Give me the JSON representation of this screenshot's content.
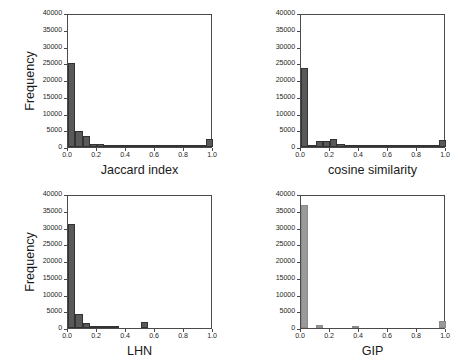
{
  "figure": {
    "width": 466,
    "height": 362,
    "background": "#ffffff",
    "layout": "2x2 grid of histogram panels"
  },
  "common": {
    "ylabel": "Frequency",
    "yticks": [
      "0",
      "5000",
      "10000",
      "15000",
      "20000",
      "25000",
      "30000",
      "35000",
      "40000"
    ],
    "ytick_values": [
      0,
      5000,
      10000,
      15000,
      20000,
      25000,
      30000,
      35000,
      40000
    ],
    "xticks": [
      "0.0",
      "0.2",
      "0.4",
      "0.6",
      "0.8",
      "1.0"
    ],
    "xtick_values": [
      0.0,
      0.2,
      0.4,
      0.6,
      0.8,
      1.0
    ],
    "ylim": [
      0,
      40000
    ],
    "xlim": [
      0.0,
      1.0
    ],
    "grid": false,
    "axis_color": "#4a4a4a"
  },
  "chart_data": [
    {
      "type": "bar",
      "id": "jaccard",
      "title": "",
      "xlabel": "Jaccard index",
      "ylabel": "Frequency",
      "xlim": [
        0.0,
        1.0
      ],
      "ylim": [
        0,
        40000
      ],
      "bin_width": 0.05,
      "bar_color": "#595959",
      "edge_color": "#333333",
      "bin_centers": [
        0.025,
        0.075,
        0.125,
        0.175,
        0.225,
        0.275,
        0.325,
        0.375,
        0.425,
        0.475,
        0.525,
        0.575,
        0.625,
        0.675,
        0.725,
        0.775,
        0.825,
        0.875,
        0.925,
        0.975
      ],
      "values": [
        25100,
        4700,
        3300,
        900,
        800,
        300,
        200,
        200,
        600,
        200,
        500,
        300,
        500,
        600,
        100,
        100,
        100,
        100,
        100,
        2300
      ]
    },
    {
      "type": "bar",
      "id": "cosine",
      "title": "",
      "xlabel": "cosine similarity",
      "ylabel": "Frequency",
      "xlim": [
        0.0,
        1.0
      ],
      "ylim": [
        0,
        40000
      ],
      "bin_width": 0.05,
      "bar_color": "#595959",
      "edge_color": "#333333",
      "bin_centers": [
        0.025,
        0.075,
        0.125,
        0.175,
        0.225,
        0.275,
        0.325,
        0.375,
        0.425,
        0.475,
        0.525,
        0.575,
        0.625,
        0.675,
        0.725,
        0.775,
        0.825,
        0.875,
        0.925,
        0.975
      ],
      "values": [
        23700,
        700,
        1900,
        1900,
        2300,
        900,
        700,
        400,
        300,
        400,
        500,
        600,
        700,
        500,
        500,
        500,
        600,
        200,
        100,
        2000
      ]
    },
    {
      "type": "bar",
      "id": "lhn",
      "title": "",
      "xlabel": "LHN",
      "ylabel": "Frequency",
      "xlim": [
        0.0,
        1.0
      ],
      "ylim": [
        0,
        40000
      ],
      "bin_width": 0.05,
      "bar_color": "#595959",
      "edge_color": "#333333",
      "bin_centers": [
        0.025,
        0.075,
        0.125,
        0.175,
        0.225,
        0.275,
        0.325,
        0.375,
        0.425,
        0.475,
        0.525,
        0.575,
        0.625,
        0.675,
        0.725,
        0.775,
        0.825,
        0.875,
        0.925,
        0.975
      ],
      "values": [
        31000,
        4100,
        1500,
        300,
        600,
        600,
        600,
        0,
        0,
        0,
        1700,
        0,
        0,
        0,
        0,
        0,
        0,
        0,
        0,
        0
      ]
    },
    {
      "type": "bar",
      "id": "gip",
      "title": "",
      "xlabel": "GIP",
      "ylabel": "Frequency",
      "xlim": [
        0.0,
        1.0
      ],
      "ylim": [
        0,
        40000
      ],
      "bin_width": 0.05,
      "bar_color": "#9a9a9a",
      "edge_color": "#8a8a8a",
      "bin_centers": [
        0.025,
        0.075,
        0.125,
        0.175,
        0.225,
        0.275,
        0.325,
        0.375,
        0.425,
        0.475,
        0.525,
        0.575,
        0.625,
        0.675,
        0.725,
        0.775,
        0.825,
        0.875,
        0.925,
        0.975
      ],
      "values": [
        36800,
        0,
        900,
        0,
        0,
        0,
        0,
        600,
        0,
        0,
        0,
        0,
        0,
        0,
        0,
        0,
        0,
        0,
        0,
        2100
      ]
    }
  ]
}
